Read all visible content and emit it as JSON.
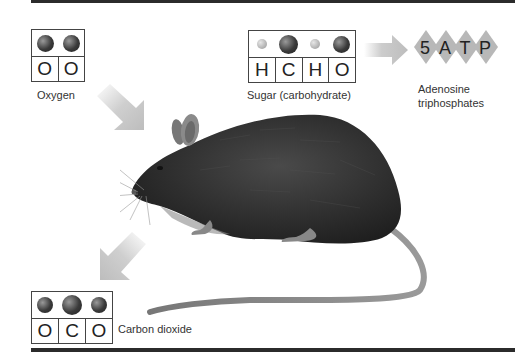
{
  "diagram": {
    "molecules": {
      "oxygen": {
        "label": "Oxygen",
        "letters": [
          "O",
          "O"
        ],
        "atoms": [
          "large",
          "large"
        ]
      },
      "sugar": {
        "label": "Sugar (carbohydrate)",
        "letters": [
          "H",
          "C",
          "H",
          "O"
        ],
        "atoms": [
          "small",
          "large",
          "small",
          "large"
        ]
      },
      "carbon_dioxide": {
        "label": "Carbon dioxide",
        "letters": [
          "O",
          "C",
          "O"
        ],
        "atoms": [
          "large",
          "large",
          "large"
        ]
      }
    },
    "atp": {
      "glyphs": [
        "5",
        "A",
        "T",
        "P"
      ],
      "label_line1": "Adenosine",
      "label_line2": "triphosphates"
    },
    "arrows": [
      {
        "name": "oxygen-in-arrow",
        "direction": "down-right"
      },
      {
        "name": "co2-out-arrow",
        "direction": "down-left"
      },
      {
        "name": "sugar-to-atp-arrow",
        "direction": "right"
      }
    ],
    "colors": {
      "rule": "#2b2b2b",
      "arrow": "#c4c4c4",
      "diamond": "#b8b8b8",
      "atom_dark": "#3a3a3a",
      "atom_light": "#c0c0c0"
    }
  }
}
